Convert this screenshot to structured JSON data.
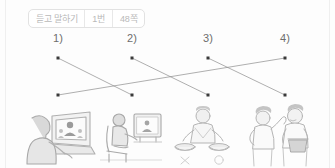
{
  "header": {
    "badge_segments": [
      {
        "name": "activity-type",
        "label": "듣고 말하기"
      },
      {
        "name": "question-number",
        "label": "1번"
      },
      {
        "name": "page-number",
        "label": "48쪽"
      }
    ]
  },
  "exercise": {
    "type": "matching",
    "top_labels": [
      {
        "id": "1",
        "label": "1)",
        "x": 58
      },
      {
        "id": "2",
        "label": "2)",
        "x": 132
      },
      {
        "id": "3",
        "label": "3)",
        "x": 208
      },
      {
        "id": "4",
        "label": "4)",
        "x": 285
      }
    ],
    "top_dots": [
      {
        "id": "top-1",
        "x": 58,
        "y": 26
      },
      {
        "id": "top-2",
        "x": 132,
        "y": 26
      },
      {
        "id": "top-3",
        "x": 208,
        "y": 26
      },
      {
        "id": "top-4",
        "x": 285,
        "y": 26
      }
    ],
    "bottom_dots": [
      {
        "id": "bottom-1",
        "x": 58,
        "y": 63
      },
      {
        "id": "bottom-2",
        "x": 132,
        "y": 63
      },
      {
        "id": "bottom-3",
        "x": 208,
        "y": 63
      },
      {
        "id": "bottom-4",
        "x": 285,
        "y": 63
      }
    ],
    "connections": [
      {
        "from": "top-1",
        "to": "bottom-2",
        "x1": 58,
        "y1": 26,
        "x2": 132,
        "y2": 63
      },
      {
        "from": "top-2",
        "to": "bottom-3",
        "x1": 132,
        "y1": 26,
        "x2": 208,
        "y2": 63
      },
      {
        "from": "top-3",
        "to": "bottom-4",
        "x1": 208,
        "y1": 26,
        "x2": 285,
        "y2": 63
      },
      {
        "from": "top-4",
        "to": "bottom-1",
        "x1": 285,
        "y1": 26,
        "x2": 58,
        "y2": 63
      }
    ],
    "line_color": "#8d8d8d",
    "dot_color": "#3a3a3a"
  },
  "illustrations": [
    {
      "id": "panel-1",
      "name": "person-watching-laptop-video-call"
    },
    {
      "id": "panel-2",
      "name": "person-seated-watching-television"
    },
    {
      "id": "panel-3",
      "name": "person-cooking-two-pans-choice"
    },
    {
      "id": "panel-4",
      "name": "two-people-one-holding-container"
    }
  ],
  "colors": {
    "background": "#fdfdfd",
    "badge_border": "#e2e2e2",
    "badge_text": "#b9b9b9",
    "label_text": "#6d6d6d",
    "illustration_ink": "#b4b4b4"
  }
}
